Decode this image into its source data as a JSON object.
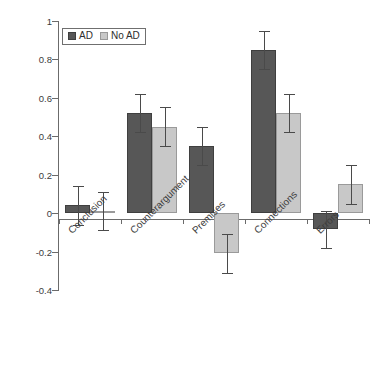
{
  "chart_data": {
    "type": "bar",
    "title": "",
    "xlabel": "",
    "ylabel": "",
    "ylim": [
      -0.4,
      1.0
    ],
    "yticks": [
      1,
      0.8,
      0.6,
      0.4,
      0.2,
      0,
      -0.2,
      -0.4
    ],
    "ytick_labels": [
      "1",
      "0.8",
      "0.6",
      "0.4",
      "0.2",
      "0",
      "-0.2",
      "-0.4"
    ],
    "grid": false,
    "legend_position": "top-left-inside",
    "categories": [
      "Conclusion",
      "Counterargument",
      "Premises",
      "Connections",
      "Errors"
    ],
    "series": [
      {
        "name": "AD",
        "color": "#575757",
        "values": [
          0.04,
          0.52,
          0.35,
          0.85,
          -0.08
        ],
        "error_low": [
          -0.06,
          0.42,
          0.25,
          0.75,
          -0.18
        ],
        "error_high": [
          0.14,
          0.62,
          0.45,
          0.95,
          0.01
        ]
      },
      {
        "name": "No AD",
        "color": "#c8c8c8",
        "values": [
          0.01,
          0.45,
          -0.21,
          0.52,
          0.15
        ],
        "error_low": [
          -0.09,
          0.35,
          -0.31,
          0.42,
          0.05
        ],
        "error_high": [
          0.11,
          0.55,
          -0.11,
          0.62,
          0.25
        ]
      }
    ]
  },
  "legend": {
    "items": [
      {
        "label": "AD",
        "swatch": "ad"
      },
      {
        "label": "No AD",
        "swatch": "noad"
      }
    ]
  },
  "colors": {
    "series_ad": "#575757",
    "series_noad": "#c8c8c8",
    "axis": "#6b6b6b",
    "text": "#3b3b3b",
    "background": "#ffffff"
  }
}
